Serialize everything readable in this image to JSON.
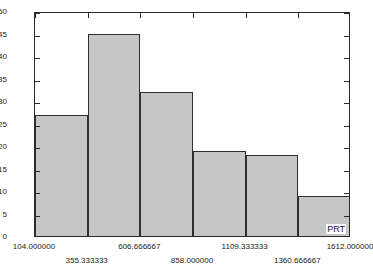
{
  "chart_data": {
    "type": "bar",
    "title": "",
    "subtitle": "",
    "xlabel": "PRT",
    "ylabel": "No of cos",
    "grid": false,
    "legend": null,
    "xlim": [
      104.0,
      1612.0
    ],
    "ylim": [
      0,
      50
    ],
    "bin_edges": [
      104.0,
      355.333333,
      606.666667,
      858.0,
      1109.333333,
      1360.666667,
      1612.0
    ],
    "categories": [
      "104.000000-355.333333",
      "355.333333-606.666667",
      "606.666667-858.000000",
      "858.000000-1109.333333",
      "1109.333333-1360.666667",
      "1360.666667-1612.000000"
    ],
    "values": [
      27,
      45,
      32,
      19,
      18,
      9
    ],
    "x_tick_labels": [
      "104.000000",
      "355.333333",
      "606.666667",
      "858.000000",
      "1109.333333",
      "1360.666667",
      "1612.000000"
    ],
    "x_tick_values": [
      104.0,
      355.333333,
      606.666667,
      858.0,
      1109.333333,
      1360.666667,
      1612.0
    ],
    "y_tick_labels": [
      "0",
      "5",
      "10",
      "15",
      "20",
      "25",
      "30",
      "35",
      "40",
      "45",
      "50"
    ],
    "y_tick_values": [
      0,
      5,
      10,
      15,
      20,
      25,
      30,
      35,
      40,
      45,
      50
    ],
    "colors": {
      "bar_fill": "#c6c6c6",
      "bar_edge": "#2f2f2f",
      "axis": "#2a2a2a",
      "background": "#ffffff",
      "text": "#1a1a1a"
    }
  }
}
